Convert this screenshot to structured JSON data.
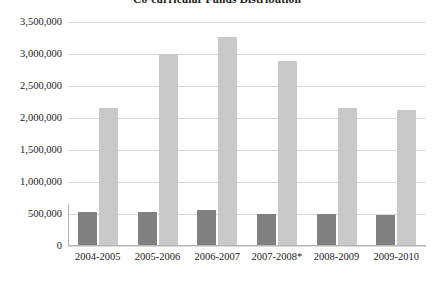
{
  "chart_data": {
    "type": "bar",
    "title": "Co-curricular Funds Distribution",
    "xlabel": "",
    "ylabel": "",
    "ylim": [
      0,
      3500000
    ],
    "ytick_step": 500000,
    "ytick_labels": [
      "3,500,000",
      "3,000,000",
      "2,500,000",
      "2,000,000",
      "1,500,000",
      "1,000,000",
      "500,000",
      "0"
    ],
    "ytick_values": [
      3500000,
      3000000,
      2500000,
      2000000,
      1500000,
      1000000,
      500000,
      0
    ],
    "categories": [
      "2004-2005",
      "2005-2006",
      "2006-2007",
      "2007-2008*",
      "2008-2009",
      "2009-2010"
    ],
    "grid": true,
    "grid_axis": "y",
    "legend": "none",
    "series": [
      {
        "name": "Series 1",
        "color": "#808080",
        "values": [
          525000,
          530000,
          565000,
          500000,
          495000,
          485000
        ]
      },
      {
        "name": "Series 2",
        "color": "#c9c9c9",
        "values": [
          2160000,
          3000000,
          3270000,
          2890000,
          2150000,
          2120000
        ]
      }
    ],
    "colors": {
      "background": "#ffffff",
      "gridline": "#d8d8d8",
      "axis": "#b5b5b5",
      "text": "#1a1a1a"
    }
  }
}
